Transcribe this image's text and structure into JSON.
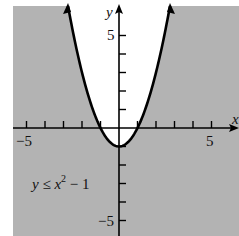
{
  "chart_data": {
    "type": "area",
    "title": "",
    "inequality": "y ≤ x² − 1",
    "boundary": {
      "equation": "y = x^2 - 1",
      "style": "solid",
      "vertex": [
        0,
        -1
      ],
      "x_intercepts": [
        -1,
        1
      ]
    },
    "shaded_region": "below parabola",
    "xlabel": "x",
    "ylabel": "y",
    "xlim": [
      -6,
      6.5
    ],
    "ylim": [
      -6,
      6.5
    ],
    "x_tick_labels": [
      "-5",
      "5"
    ],
    "y_tick_labels": [
      "5",
      "-5"
    ],
    "tick_step": 1,
    "grid": false,
    "legend": null,
    "annotation": "y ≤ x² − 1",
    "colors": {
      "shade": "#b3b3b3",
      "curve": "#000000",
      "axes": "#000000",
      "background": "#ffffff"
    }
  },
  "labels": {
    "x_axis": "x",
    "y_axis": "y",
    "x_neg": "−5",
    "x_pos": "5",
    "y_pos": "5",
    "y_neg": "−5",
    "inequality_prefix": "y ≤ x",
    "inequality_exp": "2",
    "inequality_suffix": " − 1"
  }
}
